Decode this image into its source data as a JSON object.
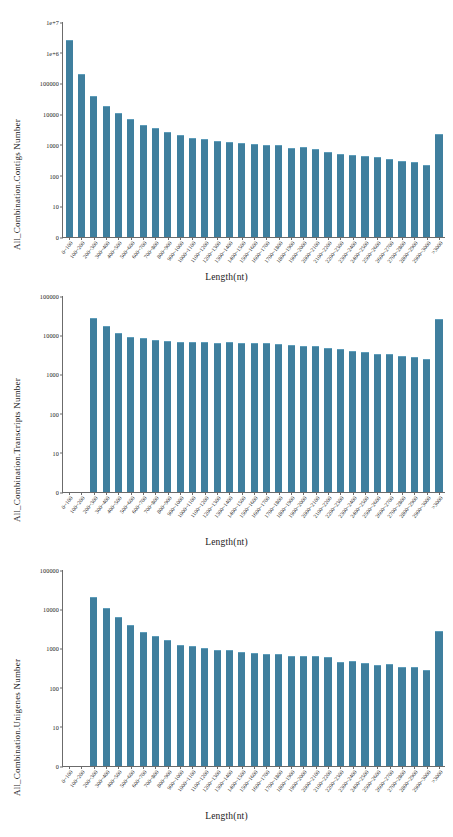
{
  "figure": {
    "background": "#ffffff",
    "bar_color": "#3f7f9e",
    "bar_edge_color": "#5e9dba",
    "axis_color": "#6b6b6b"
  },
  "categories": [
    "0~100",
    "100~200",
    "200~300",
    "300~400",
    "400~500",
    "500~600",
    "600~700",
    "700~800",
    "800~900",
    "900~1000",
    "1000~1100",
    "1100~1200",
    "1200~1300",
    "1300~1400",
    "1400~1500",
    "1500~1600",
    "1600~1700",
    "1700~1800",
    "1800~1900",
    "1900~2000",
    "2000~2100",
    "2100~2200",
    "2200~2300",
    "2300~2400",
    "2400~2500",
    "2500~2600",
    "2600~2700",
    "2700~2800",
    "2800~2900",
    "2900~3000",
    ">3000"
  ],
  "charts": [
    {
      "id": "contigs",
      "ylabel": "All_Combination.Contigs Number",
      "xlabel": "Length(nt)",
      "yticks": [
        "0",
        "10",
        "100",
        "1000",
        "10000",
        "100000",
        "1e+6",
        "1e+7"
      ]
    },
    {
      "id": "transcripts",
      "ylabel": "All_Combination.Transcripts Number",
      "xlabel": "Length(nt)",
      "yticks": [
        "0",
        "10",
        "100",
        "1000",
        "10000",
        "100000"
      ]
    },
    {
      "id": "unigenes",
      "ylabel": "All_Combination.Unigenes Number",
      "xlabel": "Length(nt)",
      "yticks": [
        "0",
        "10",
        "100",
        "1000",
        "10000",
        "100000"
      ]
    }
  ],
  "chart_data": [
    {
      "type": "bar",
      "title": "",
      "xlabel": "Length(nt)",
      "ylabel": "All_Combination.Contigs Number",
      "yscale": "log",
      "ylim": [
        0,
        10000000
      ],
      "ytick_values": [
        0,
        10,
        100,
        1000,
        10000,
        100000,
        1000000,
        10000000
      ],
      "ytick_labels": [
        "0",
        "10",
        "100",
        "1000",
        "10000",
        "100000",
        "1e+6",
        "1e+7"
      ],
      "grid": false,
      "legend": "none",
      "categories": [
        "0~100",
        "100~200",
        "200~300",
        "300~400",
        "400~500",
        "500~600",
        "600~700",
        "700~800",
        "800~900",
        "900~1000",
        "1000~1100",
        "1100~1200",
        "1200~1300",
        "1300~1400",
        "1400~1500",
        "1500~1600",
        "1600~1700",
        "1700~1800",
        "1800~1900",
        "1900~2000",
        "2000~2100",
        "2100~2200",
        "2200~2300",
        "2300~2400",
        "2400~2500",
        "2500~2600",
        "2600~2700",
        "2700~2800",
        "2800~2900",
        "2900~3000",
        ">3000"
      ],
      "values": [
        2400000,
        190000,
        36000,
        17500,
        10100,
        6400,
        4200,
        3200,
        2400,
        1900,
        1600,
        1400,
        1200,
        1130,
        1030,
        970,
        920,
        940,
        760,
        770,
        690,
        550,
        480,
        440,
        390,
        360,
        320,
        280,
        250,
        210,
        2100
      ]
    },
    {
      "type": "bar",
      "title": "",
      "xlabel": "Length(nt)",
      "ylabel": "All_Combination.Transcripts Number",
      "yscale": "log",
      "ylim": [
        0,
        100000
      ],
      "ytick_values": [
        0,
        10,
        100,
        1000,
        10000,
        100000
      ],
      "ytick_labels": [
        "0",
        "10",
        "100",
        "1000",
        "10000",
        "100000"
      ],
      "grid": false,
      "legend": "none",
      "categories": [
        "0~100",
        "100~200",
        "200~300",
        "300~400",
        "400~500",
        "500~600",
        "600~700",
        "700~800",
        "800~900",
        "900~1000",
        "1000~1100",
        "1100~1200",
        "1200~1300",
        "1300~1400",
        "1400~1500",
        "1500~1600",
        "1600~1700",
        "1700~1800",
        "1800~1900",
        "1900~2000",
        "2000~2100",
        "2100~2200",
        "2200~2300",
        "2300~2400",
        "2400~2500",
        "2500~2600",
        "2600~2700",
        "2700~2800",
        "2800~2900",
        "2900~3000",
        ">3000"
      ],
      "values": [
        0,
        0,
        26000,
        16000,
        10500,
        8700,
        7800,
        7200,
        6600,
        6400,
        6200,
        6300,
        5900,
        6200,
        6000,
        6000,
        5900,
        5600,
        5300,
        5100,
        4900,
        4500,
        4100,
        3700,
        3500,
        3200,
        3100,
        2800,
        2600,
        2350,
        24000
      ]
    },
    {
      "type": "bar",
      "title": "",
      "xlabel": "Length(nt)",
      "ylabel": "All_Combination.Unigenes Number",
      "yscale": "log",
      "ylim": [
        0,
        100000
      ],
      "ytick_values": [
        0,
        10,
        100,
        1000,
        10000,
        100000
      ],
      "ytick_labels": [
        "0",
        "10",
        "100",
        "1000",
        "10000",
        "100000"
      ],
      "grid": false,
      "legend": "none",
      "categories": [
        "0~100",
        "100~200",
        "200~300",
        "300~400",
        "400~500",
        "500~600",
        "600~700",
        "700~800",
        "800~900",
        "900~1000",
        "1000~1100",
        "1100~1200",
        "1200~1300",
        "1300~1400",
        "1400~1500",
        "1500~1600",
        "1600~1700",
        "1700~1800",
        "1800~1900",
        "1900~2000",
        "2000~2100",
        "2100~2200",
        "2200~2300",
        "2300~2400",
        "2400~2500",
        "2500~2600",
        "2600~2700",
        "2700~2800",
        "2800~2900",
        "2900~3000",
        ">3000"
      ],
      "values": [
        0,
        0,
        19000,
        10100,
        6000,
        3800,
        2450,
        1900,
        1550,
        1170,
        1060,
        990,
        840,
        850,
        780,
        730,
        690,
        690,
        620,
        620,
        590,
        570,
        430,
        440,
        400,
        350,
        370,
        310,
        310,
        260,
        2700
      ]
    }
  ]
}
